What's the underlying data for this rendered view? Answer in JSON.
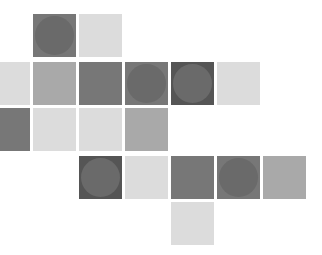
{
  "board": {
    "tile_size": 43,
    "columns_x": [
      -13,
      33,
      79,
      125,
      171,
      217,
      263
    ],
    "rows_y": [
      14,
      62,
      108,
      156,
      202
    ],
    "colors": {
      "light": "#dcdcdc",
      "medium": "#a9a9a9",
      "dark": "#777777",
      "darker": "#555555",
      "piece": "#6a6a6a"
    },
    "tiles": [
      {
        "col": 1,
        "row": 0,
        "tone": "dark",
        "piece": true
      },
      {
        "col": 2,
        "row": 0,
        "tone": "light",
        "piece": false
      },
      {
        "col": 0,
        "row": 1,
        "tone": "light",
        "piece": false
      },
      {
        "col": 1,
        "row": 1,
        "tone": "medium",
        "piece": false
      },
      {
        "col": 2,
        "row": 1,
        "tone": "dark",
        "piece": false
      },
      {
        "col": 3,
        "row": 1,
        "tone": "dark",
        "piece": true
      },
      {
        "col": 4,
        "row": 1,
        "tone": "darker",
        "piece": true
      },
      {
        "col": 5,
        "row": 1,
        "tone": "light",
        "piece": false
      },
      {
        "col": 0,
        "row": 2,
        "tone": "dark",
        "piece": false
      },
      {
        "col": 1,
        "row": 2,
        "tone": "light",
        "piece": false
      },
      {
        "col": 2,
        "row": 2,
        "tone": "light",
        "piece": false
      },
      {
        "col": 3,
        "row": 2,
        "tone": "medium",
        "piece": false
      },
      {
        "col": 2,
        "row": 3,
        "tone": "darker",
        "piece": true
      },
      {
        "col": 3,
        "row": 3,
        "tone": "light",
        "piece": false
      },
      {
        "col": 4,
        "row": 3,
        "tone": "dark",
        "piece": false
      },
      {
        "col": 5,
        "row": 3,
        "tone": "dark",
        "piece": true
      },
      {
        "col": 6,
        "row": 3,
        "tone": "medium",
        "piece": false
      },
      {
        "col": 4,
        "row": 4,
        "tone": "light",
        "piece": false
      }
    ]
  }
}
